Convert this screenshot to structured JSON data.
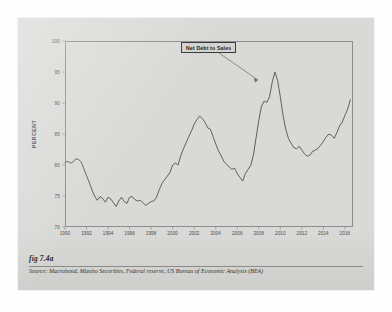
{
  "figure": {
    "caption": "fig 7.4a",
    "source": "Source:  Macrobond, Mizuho Securities, Federal reserve, US Bureau of Economic Analysis (BEA)"
  },
  "colors": {
    "page_background": "#ffffff",
    "card_background": "#d9d9d7",
    "plot_border": "#8d8d8b",
    "line": "#4a4a48",
    "callout_border": "#3a3a38",
    "tick_text": "#4a4a48"
  },
  "chart_data": {
    "type": "line",
    "title": "",
    "xlabel": "",
    "ylabel": "PERCENT",
    "annotation": "Net Debt to Sales",
    "grid": false,
    "legend": "none",
    "xlim": [
      1990,
      2016.75
    ],
    "ylim": [
      70,
      100
    ],
    "ytick_labels": [
      "100",
      "95",
      "90",
      "85",
      "80",
      "75",
      "70"
    ],
    "yticks": [
      100,
      95,
      90,
      85,
      80,
      75,
      70
    ],
    "xtick_labels": [
      "1990",
      "1992",
      "1994",
      "1996",
      "1998",
      "2000",
      "2002",
      "2004",
      "2006",
      "2008",
      "2010",
      "2012",
      "2014",
      "2016"
    ],
    "xticks": [
      1990,
      1992,
      1994,
      1996,
      1998,
      2000,
      2002,
      2004,
      2006,
      2008,
      2010,
      2012,
      2014,
      2016
    ],
    "series": [
      {
        "name": "Net Debt to Sales",
        "units": "percent",
        "x": [
          1990.0,
          1990.25,
          1990.5,
          1990.75,
          1991.0,
          1991.25,
          1991.5,
          1991.75,
          1992.0,
          1992.25,
          1992.5,
          1992.75,
          1993.0,
          1993.25,
          1993.5,
          1993.75,
          1994.0,
          1994.25,
          1994.5,
          1994.75,
          1995.0,
          1995.25,
          1995.5,
          1995.75,
          1996.0,
          1996.25,
          1996.5,
          1996.75,
          1997.0,
          1997.25,
          1997.5,
          1997.75,
          1998.0,
          1998.25,
          1998.5,
          1998.75,
          1999.0,
          1999.25,
          1999.5,
          1999.75,
          2000.0,
          2000.25,
          2000.5,
          2000.75,
          2001.0,
          2001.25,
          2001.5,
          2001.75,
          2002.0,
          2002.25,
          2002.5,
          2002.75,
          2003.0,
          2003.25,
          2003.5,
          2003.75,
          2004.0,
          2004.25,
          2004.5,
          2004.75,
          2005.0,
          2005.25,
          2005.5,
          2005.75,
          2006.0,
          2006.25,
          2006.5,
          2006.75,
          2007.0,
          2007.25,
          2007.5,
          2007.75,
          2008.0,
          2008.25,
          2008.5,
          2008.75,
          2009.0,
          2009.25,
          2009.5,
          2009.75,
          2010.0,
          2010.25,
          2010.5,
          2010.75,
          2011.0,
          2011.25,
          2011.5,
          2011.75,
          2012.0,
          2012.25,
          2012.5,
          2012.75,
          2013.0,
          2013.25,
          2013.5,
          2013.75,
          2014.0,
          2014.25,
          2014.5,
          2014.75,
          2015.0,
          2015.25,
          2015.5,
          2015.75,
          2016.0,
          2016.25,
          2016.5
        ],
        "values": [
          80.4,
          80.6,
          80.3,
          80.5,
          81.0,
          80.9,
          80.5,
          79.4,
          78.3,
          77.2,
          76.0,
          75.0,
          74.3,
          74.9,
          74.6,
          74.0,
          74.8,
          74.5,
          73.9,
          73.3,
          74.2,
          74.8,
          74.1,
          73.8,
          74.8,
          74.9,
          74.4,
          74.2,
          74.3,
          73.9,
          73.5,
          73.8,
          74.1,
          74.2,
          74.8,
          76.0,
          77.0,
          77.6,
          78.2,
          78.8,
          80.0,
          80.3,
          80.0,
          81.5,
          82.6,
          83.6,
          84.6,
          85.5,
          86.6,
          87.3,
          87.9,
          87.5,
          86.9,
          86.0,
          85.8,
          84.6,
          83.4,
          82.3,
          81.5,
          80.6,
          80.1,
          79.7,
          79.3,
          79.5,
          78.6,
          78.0,
          77.4,
          78.6,
          79.3,
          79.9,
          81.6,
          84.4,
          87.2,
          89.5,
          90.3,
          90.1,
          91.0,
          93.4,
          95.0,
          93.6,
          91.0,
          88.0,
          85.8,
          84.3,
          83.5,
          82.8,
          82.6,
          83.0,
          82.4,
          81.8,
          81.4,
          81.6,
          82.2,
          82.4,
          82.7,
          83.2,
          83.8,
          84.5,
          85.0,
          84.8,
          84.3,
          85.2,
          86.3,
          86.9,
          88.0,
          89.0,
          90.5
        ]
      }
    ]
  }
}
